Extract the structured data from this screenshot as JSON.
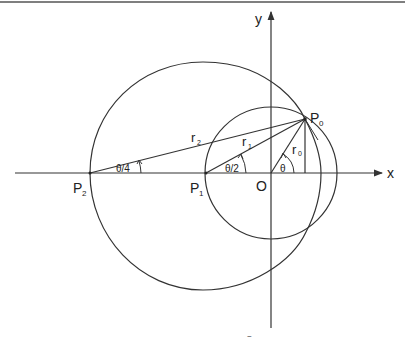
{
  "diagram": {
    "axes": {
      "x_label": "x",
      "y_label": "y",
      "origin_label": "O"
    },
    "points": {
      "p0": {
        "label": "P",
        "sub": "0"
      },
      "p1": {
        "label": "P",
        "sub": "1"
      },
      "p2": {
        "label": "P",
        "sub": "2"
      }
    },
    "radii": {
      "r0": {
        "label": "r",
        "sub": "0"
      },
      "r1": {
        "label": "r",
        "sub": "1"
      },
      "r2": {
        "label": "r",
        "sub": "2"
      }
    },
    "angles": {
      "theta": "θ",
      "theta_half": "θ/2",
      "theta_quarter": "θ/4"
    },
    "footer_mark": "~",
    "colors": {
      "stroke": "#333333",
      "background": "#ffffff"
    }
  }
}
